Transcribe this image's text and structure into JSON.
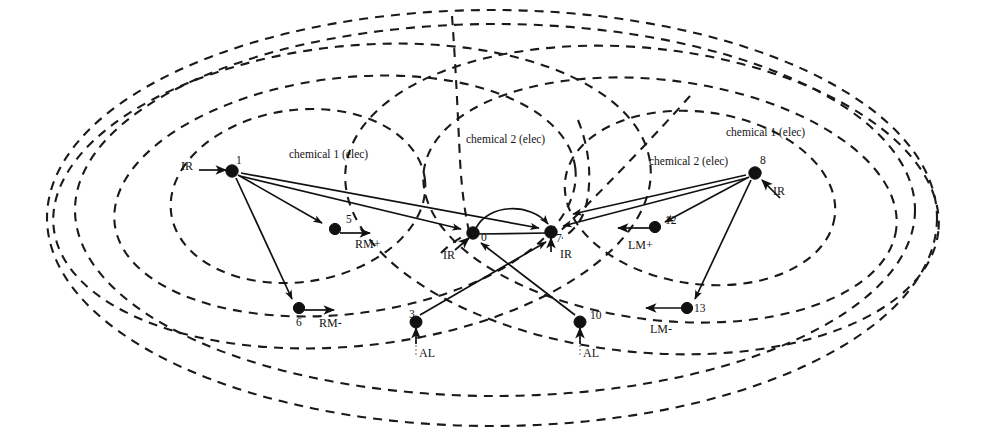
{
  "diagram": {
    "canvas": {
      "width": 981,
      "height": 446
    },
    "colors": {
      "ink": "#111111",
      "dash": "#1a1a1a",
      "background": "#ffffff"
    },
    "nodes": [
      {
        "id": "1",
        "label": "1",
        "x": 232,
        "y": 171
      },
      {
        "id": "5",
        "label": "5",
        "x": 335,
        "y": 229
      },
      {
        "id": "6",
        "label": "6",
        "x": 299,
        "y": 308
      },
      {
        "id": "3",
        "label": "3",
        "x": 416,
        "y": 322
      },
      {
        "id": "0",
        "label": "0",
        "x": 473,
        "y": 233
      },
      {
        "id": "7",
        "label": "7",
        "x": 551,
        "y": 232
      },
      {
        "id": "10",
        "label": "10",
        "x": 580,
        "y": 322
      },
      {
        "id": "12",
        "label": "12",
        "x": 655,
        "y": 227
      },
      {
        "id": "13",
        "label": "13",
        "x": 687,
        "y": 308
      },
      {
        "id": "8",
        "label": "8",
        "x": 755,
        "y": 173
      }
    ],
    "node_labels": [
      {
        "text": "1",
        "x": 236,
        "y": 155
      },
      {
        "text": "5",
        "x": 346,
        "y": 214
      },
      {
        "text": "6",
        "x": 296,
        "y": 317
      },
      {
        "text": "3",
        "x": 409,
        "y": 309
      },
      {
        "text": "0",
        "x": 481,
        "y": 232
      },
      {
        "text": "7",
        "x": 556,
        "y": 233
      },
      {
        "text": "10",
        "x": 590,
        "y": 310
      },
      {
        "text": "12",
        "x": 665,
        "y": 215
      },
      {
        "text": "13",
        "x": 694,
        "y": 303
      },
      {
        "text": "8",
        "x": 760,
        "y": 155
      }
    ],
    "sensor_labels": [
      {
        "text": "IR",
        "x": 181,
        "y": 160
      },
      {
        "text": "RM+",
        "x": 355,
        "y": 238
      },
      {
        "text": "RM-",
        "x": 319,
        "y": 317
      },
      {
        "text": "AL",
        "x": 419,
        "y": 347
      },
      {
        "text": "IR",
        "x": 443,
        "y": 249
      },
      {
        "text": "IR",
        "x": 560,
        "y": 248
      },
      {
        "text": "AL",
        "x": 583,
        "y": 347
      },
      {
        "text": "LM+",
        "x": 628,
        "y": 239
      },
      {
        "text": "LM-",
        "x": 650,
        "y": 323
      },
      {
        "text": "IR",
        "x": 773,
        "y": 185
      }
    ],
    "field_labels": [
      {
        "text": "chemical 1 (elec)",
        "x": 289,
        "y": 149
      },
      {
        "text": "chemical 2  (elec)",
        "x": 466,
        "y": 134
      },
      {
        "text": "chemical 2  (elec)",
        "x": 649,
        "y": 156
      },
      {
        "text": "chemical 1 (elec)",
        "x": 726,
        "y": 127
      }
    ],
    "links": [
      {
        "from": "1",
        "to": "5",
        "arrow": "to"
      },
      {
        "from": "1",
        "to": "6",
        "arrow": "to"
      },
      {
        "from": "1",
        "to": "0",
        "arrow": "to"
      },
      {
        "from": "1",
        "to": "7",
        "arrow": "to"
      },
      {
        "from": "8",
        "to": "12",
        "arrow": "to"
      },
      {
        "from": "8",
        "to": "13",
        "arrow": "to"
      },
      {
        "from": "8",
        "to": "7",
        "arrow": "to"
      },
      {
        "from": "8",
        "to": "0",
        "arrow": "to"
      },
      {
        "from": "3",
        "to": "7",
        "arrow": "to"
      },
      {
        "from": "10",
        "to": "0",
        "arrow": "to"
      },
      {
        "from": "0",
        "to": "7",
        "arrow": "to",
        "style": "arc"
      },
      {
        "from": "0",
        "to": "7",
        "arrow": "none",
        "style": "straight"
      }
    ],
    "fields": {
      "chemical_1": {
        "label": "chemical 1 (elec)",
        "ring_count": 3
      },
      "chemical_2": {
        "label": "chemical 2  (elec)",
        "ring_count": 3
      }
    }
  }
}
